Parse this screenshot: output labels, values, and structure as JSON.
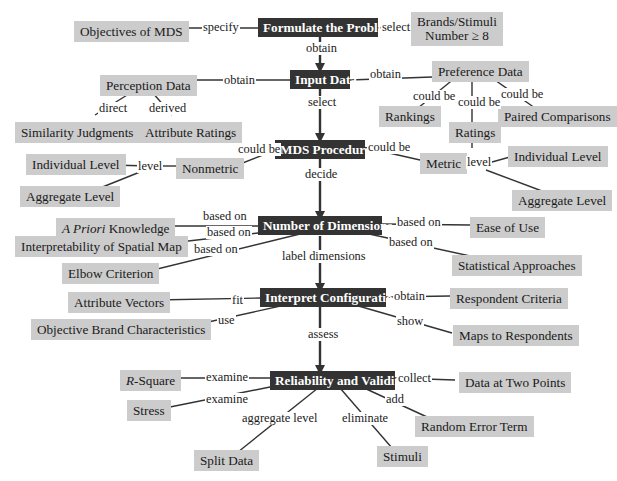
{
  "diagram": {
    "type": "concept-map",
    "colors": {
      "main_node_bg": "#333333",
      "main_node_text": "#ffffff",
      "sub_node_bg": "#cccccc",
      "line": "#333333"
    },
    "main_nodes": {
      "formulate": "Formulate the Problem",
      "input": "Input Data",
      "procedure": "MDS Procedure",
      "dimensions": "Number of Dimensions",
      "interpret": "Interpret Configuration",
      "reliability": "Reliability and Validity"
    },
    "sub_nodes": {
      "objectives": "Objectives of MDS",
      "brands_line1": "Brands/Stimuli",
      "brands_line2": "Number ≥ 8",
      "perception": "Perception Data",
      "preference": "Preference Data",
      "similarity": "Similarity Judgments",
      "attribute_ratings": "Attribute Ratings",
      "rankings": "Rankings",
      "ratings": "Ratings",
      "paired": "Paired Comparisons",
      "nonmetric": "Nonmetric",
      "nm_individual": "Individual Level",
      "nm_aggregate": "Aggregate Level",
      "metric": "Metric",
      "m_individual": "Individual Level",
      "m_aggregate": "Aggregate Level",
      "apriori_italic": "A Priori",
      "apriori_rest": " Knowledge",
      "interpretability": "Interpretability of Spatial Map",
      "elbow": "Elbow Criterion",
      "ease": "Ease of Use",
      "statistical": "Statistical Approaches",
      "attr_vectors": "Attribute Vectors",
      "objective_brand": "Objective Brand Characteristics",
      "respondent_criteria": "Respondent Criteria",
      "maps": "Maps to Respondents",
      "rsquare_italic": "R",
      "rsquare_rest": "-Square",
      "stress": "Stress",
      "data_two": "Data at Two Points",
      "random_error": "Random Error Term",
      "split": "Split Data",
      "stimuli": "Stimuli"
    },
    "link_labels": {
      "specify": "specify",
      "select_brands": "select",
      "obtain_input": "obtain",
      "obtain_perception": "obtain",
      "obtain_preference": "obtain",
      "direct": "direct",
      "derived": "derived",
      "could_be_rank": "could be",
      "could_be_rate": "could be",
      "could_be_paired": "could be",
      "select_proc": "select",
      "could_be_nonmetric": "could be",
      "could_be_metric": "could be",
      "nm_level": "level",
      "m_level": "level",
      "decide": "decide",
      "based_on_1": "based on",
      "based_on_2": "based on",
      "based_on_3": "based on",
      "based_on_4": "based on",
      "based_on_5": "based on",
      "label_dimensions": "label dimensions",
      "fit": "fit",
      "use": "use",
      "obtain_criteria": "obtain",
      "show": "show",
      "assess": "assess",
      "examine_1": "examine",
      "examine_2": "examine",
      "collect": "collect",
      "add": "add",
      "aggregate_level": "aggregate level",
      "eliminate": "eliminate"
    }
  }
}
